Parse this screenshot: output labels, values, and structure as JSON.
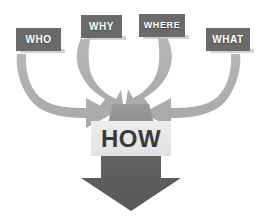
{
  "diagram": {
    "type": "funnel-arrow",
    "background_color": "#ffffff",
    "colors": {
      "question_box_fill": "#6a6a6a",
      "question_box_shadow": "#c9c9c9",
      "question_box_text": "#ffffff",
      "curved_arrow_fill": "#b0b0b0",
      "funnel_fill": "#8e8e8e",
      "big_arrow_fill": "#5e5e5e",
      "how_box_fill": "#e8e8e8",
      "how_box_text": "#3a3a3a"
    },
    "top_partial_text": "",
    "question_boxes": [
      {
        "id": "who",
        "label": "WHO",
        "x": 16,
        "y": 28,
        "w": 45,
        "h": 23,
        "font_size": 10
      },
      {
        "id": "why",
        "label": "WHY",
        "x": 81,
        "y": 15,
        "w": 41,
        "h": 23,
        "font_size": 10
      },
      {
        "id": "where",
        "label": "WHERE",
        "x": 139,
        "y": 14,
        "w": 46,
        "h": 23,
        "font_size": 10
      },
      {
        "id": "what",
        "label": "WHAT",
        "x": 206,
        "y": 28,
        "w": 44,
        "h": 23,
        "font_size": 10
      }
    ],
    "center_box": {
      "id": "how",
      "label": "HOW",
      "x": 91,
      "y": 121,
      "w": 80,
      "h": 35,
      "font_size": 24
    },
    "flow": {
      "inputs": [
        "WHO",
        "WHY",
        "WHERE",
        "WHAT"
      ],
      "output": "HOW",
      "arrow_count": 4,
      "direction": "converge-down"
    }
  }
}
